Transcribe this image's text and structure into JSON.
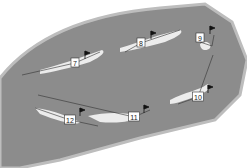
{
  "map": {
    "type": "golf-course-layout",
    "colors": {
      "rough": "#8c8c8c",
      "outer": "#bdbdbd",
      "fairway": "#ececec",
      "line": "#333333",
      "background": "#ffffff"
    },
    "holes": [
      {
        "number": "7",
        "label_x": 75,
        "label_y": 63
      },
      {
        "number": "8",
        "label_x": 141,
        "label_y": 43
      },
      {
        "number": "9",
        "label_x": 200,
        "label_y": 38
      },
      {
        "number": "10",
        "label_x": 198,
        "label_y": 97
      },
      {
        "number": "11",
        "label_x": 134,
        "label_y": 117
      },
      {
        "number": "12",
        "label_x": 70,
        "label_y": 120
      }
    ]
  }
}
